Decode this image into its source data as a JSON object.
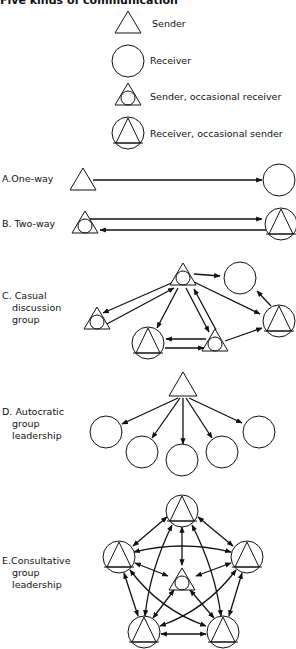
{
  "title": "Five kinds of communication",
  "legend": [
    {
      "symbol": "triangle",
      "label": "Sender"
    },
    {
      "symbol": "circle",
      "label": "Receiver"
    },
    {
      "symbol": "triangle-with-circle",
      "label": "Sender, occasional receiver"
    },
    {
      "symbol": "circle-with-triangle",
      "label": "Receiver, occasional sender"
    }
  ],
  "sections": [
    {
      "letter": "A.",
      "lines": [
        "One-way"
      ]
    },
    {
      "letter": "B.",
      "lines": [
        "Two-way"
      ]
    },
    {
      "letter": "C.",
      "lines": [
        "Casual",
        "discussion",
        "group"
      ]
    },
    {
      "letter": "D.",
      "lines": [
        "Autocratic",
        "group",
        "leadership"
      ]
    },
    {
      "letter": "E.",
      "lines": [
        "Consultative",
        "group",
        "leadership"
      ]
    }
  ],
  "colors": {
    "ink": "#111111",
    "background": "#ffffff"
  }
}
